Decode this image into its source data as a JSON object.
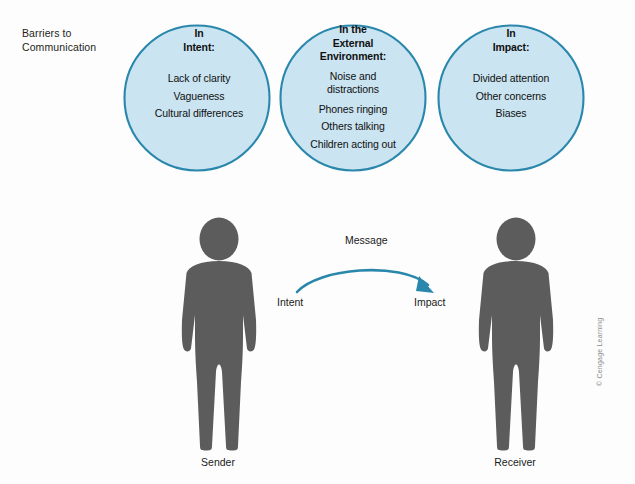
{
  "figure": {
    "corner_label_line1": "Barriers to",
    "corner_label_line2": "Communication",
    "credit": "© Cengage Learning"
  },
  "colors": {
    "circle_fill": "#c3e0ef",
    "circle_stroke": "#2a87ac",
    "person_fill": "#5c5c5c",
    "arrow": "#2a87ac",
    "text": "#101010",
    "background": "#fdfdfd"
  },
  "venn": {
    "circles": [
      {
        "id": "intent",
        "title_line1": "In",
        "title_line2": "Intent:",
        "items": [
          "Lack of clarity",
          "Vagueness",
          "Cultural differences"
        ],
        "cx": 197,
        "cy": 98,
        "r": 73
      },
      {
        "id": "external-environment",
        "title_line1": "In the",
        "title_line2": "External",
        "title_line3": "Environment:",
        "items": [
          "Noise and distractions",
          "Phones ringing",
          "Others talking",
          "Children acting out"
        ],
        "cx": 353,
        "cy": 98,
        "r": 73
      },
      {
        "id": "impact",
        "title_line1": "In",
        "title_line2": "Impact:",
        "items": [
          "Divided attention",
          "Other concerns",
          "Biases"
        ],
        "cx": 511,
        "cy": 98,
        "r": 73
      }
    ]
  },
  "flow": {
    "message_label": "Message",
    "start_label": "Intent",
    "end_label": "Impact"
  },
  "people": [
    {
      "id": "sender",
      "label": "Sender"
    },
    {
      "id": "receiver",
      "label": "Receiver"
    }
  ]
}
